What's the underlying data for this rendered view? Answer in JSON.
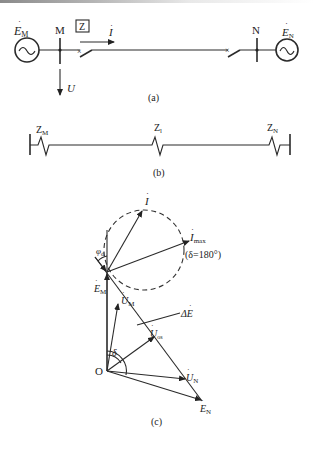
{
  "figure": {
    "panel_a": {
      "caption": "(a)",
      "source_left_label": "E",
      "source_left_sub": "M",
      "source_right_label": "E",
      "source_right_sub": "N",
      "bus_left": "M",
      "bus_right": "N",
      "relay_label": "Z",
      "current_label": "I",
      "voltage_label": "U"
    },
    "panel_b": {
      "caption": "(b)",
      "impedances": [
        {
          "label": "Z",
          "sub": "M"
        },
        {
          "label": "Z",
          "sub": "l"
        },
        {
          "label": "Z",
          "sub": "N"
        }
      ]
    },
    "panel_c": {
      "caption": "(c)",
      "origin": "O",
      "phasors": {
        "I": {
          "label": "I",
          "sub": ""
        },
        "I_max": {
          "label": "I",
          "sub": "max"
        },
        "delta_note": "(δ=180°)",
        "phi": {
          "label": "φ",
          "sub": "d"
        },
        "E_M": {
          "label": "E",
          "sub": "M"
        },
        "U_M": {
          "label": "U",
          "sub": "M"
        },
        "dE": {
          "label": "ΔE",
          "sub": ""
        },
        "U_os": {
          "label": "U",
          "sub": "os"
        },
        "U_N": {
          "label": "U",
          "sub": "N"
        },
        "E_N": {
          "label": "E",
          "sub": "N"
        },
        "delta": "δ"
      }
    }
  }
}
